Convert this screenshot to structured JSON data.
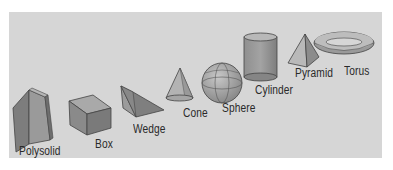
{
  "figure": {
    "background_color": "#d6d6d6",
    "shapes": [
      {
        "id": "polysolid",
        "label": "Polysolid"
      },
      {
        "id": "box",
        "label": "Box"
      },
      {
        "id": "wedge",
        "label": "Wedge"
      },
      {
        "id": "cone",
        "label": "Cone"
      },
      {
        "id": "sphere",
        "label": "Sphere"
      },
      {
        "id": "cylinder",
        "label": "Cylinder"
      },
      {
        "id": "pyramid",
        "label": "Pyramid"
      },
      {
        "id": "torus",
        "label": "Torus"
      }
    ]
  }
}
